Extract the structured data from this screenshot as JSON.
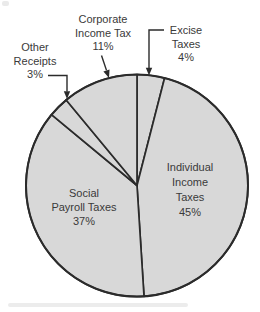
{
  "chart_data": {
    "type": "pie",
    "units": "%",
    "total": 100,
    "start_angle_deg": 0,
    "direction": "clockwise",
    "legend": "none",
    "slices": [
      {
        "id": "excise",
        "label": "Excise Taxes",
        "value": 4,
        "label_lines": [
          "Excise",
          "Taxes",
          "4%"
        ],
        "label_placement": "outside-top-right-elbow-arrow"
      },
      {
        "id": "individual",
        "label": "Individual Income Taxes",
        "value": 45,
        "label_lines": [
          "Individual",
          "Income",
          "Taxes",
          "45%"
        ],
        "label_placement": "inside-right"
      },
      {
        "id": "social",
        "label": "Social Payroll Taxes",
        "value": 37,
        "label_lines": [
          "Social",
          "Payroll Taxes",
          "37%"
        ],
        "label_placement": "inside-left"
      },
      {
        "id": "other",
        "label": "Other Receipts",
        "value": 3,
        "label_lines": [
          "Other",
          "Receipts",
          "3%"
        ],
        "label_placement": "outside-top-left-elbow-arrow"
      },
      {
        "id": "corporate",
        "label": "Corporate Income Tax",
        "value": 11,
        "label_lines": [
          "Corporate",
          "Income Tax",
          "11%"
        ],
        "label_placement": "outside-top-arrow"
      }
    ],
    "style": {
      "pie_fill": "#d8d8d8",
      "line_stroke": "#2b2b2b",
      "text_color": "#3a3a3a",
      "background": "#ffffff"
    }
  }
}
